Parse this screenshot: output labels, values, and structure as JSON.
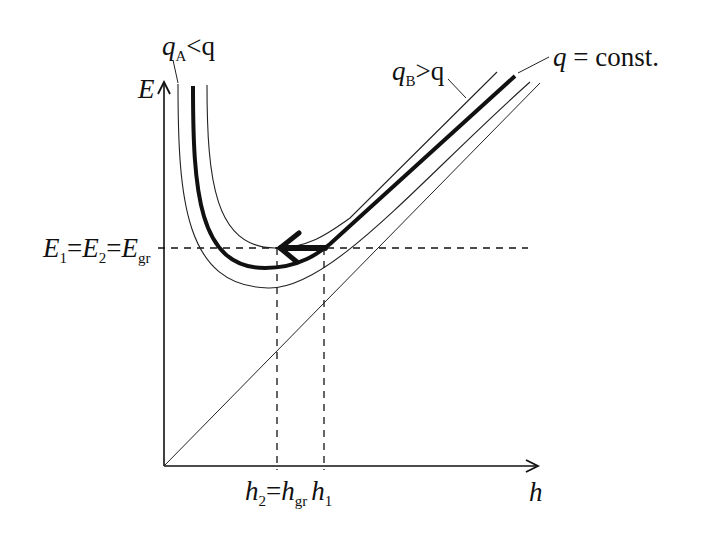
{
  "diagram": {
    "axes": {
      "y_label": "E",
      "x_label": "h"
    },
    "curves": [
      {
        "id": "q",
        "label_main": "q",
        "label_rest": " = const.",
        "style": "thick",
        "color": "#111111"
      },
      {
        "id": "qA",
        "label_main": "q",
        "label_sub": "A",
        "label_rest": "<q",
        "style": "thin",
        "color": "#333333"
      },
      {
        "id": "qB",
        "label_main": "q",
        "label_sub": "B",
        "label_rest": ">q",
        "style": "thin",
        "color": "#333333"
      }
    ],
    "asymptote": {
      "equation": "E = h",
      "style": "thin"
    },
    "energy_level_label": {
      "E1": "E",
      "E1_sub": "1",
      "eq1": "=",
      "E2": "E",
      "E2_sub": "2",
      "eq2": "=",
      "Egr": "E",
      "Egr_sub": "gr"
    },
    "depth_labels": {
      "h2": "h",
      "h2_sub": "2",
      "eq": "=",
      "hgr": "h",
      "hgr_sub": "gr",
      "h1": "h",
      "h1_sub": "1"
    },
    "arrow": {
      "from": "h1",
      "to": "h2",
      "direction": "left"
    }
  }
}
